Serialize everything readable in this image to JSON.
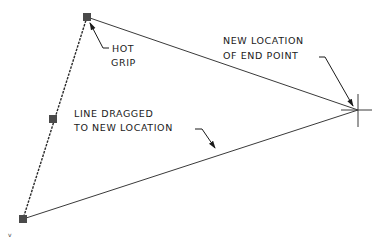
{
  "diagram": {
    "type": "cad-grip-stretch",
    "colors": {
      "line": "#3a3a3a",
      "grip": "#4a4a4a",
      "text": "#1a1a1a",
      "background": "#ffffff"
    },
    "points": {
      "top_grip": {
        "x": 87,
        "y": 17
      },
      "mid_grip": {
        "x": 53,
        "y": 119
      },
      "bottom_grip": {
        "x": 23,
        "y": 219
      },
      "end_point": {
        "x": 358,
        "y": 110
      }
    },
    "labels": {
      "hot_grip": [
        "HOT",
        "GRIP"
      ],
      "new_location": [
        "NEW LOCATION",
        "OF END POINT"
      ],
      "line_dragged": [
        "LINE DRAGGED",
        "TO NEW LOCATION"
      ],
      "corner_mark": "v"
    }
  }
}
